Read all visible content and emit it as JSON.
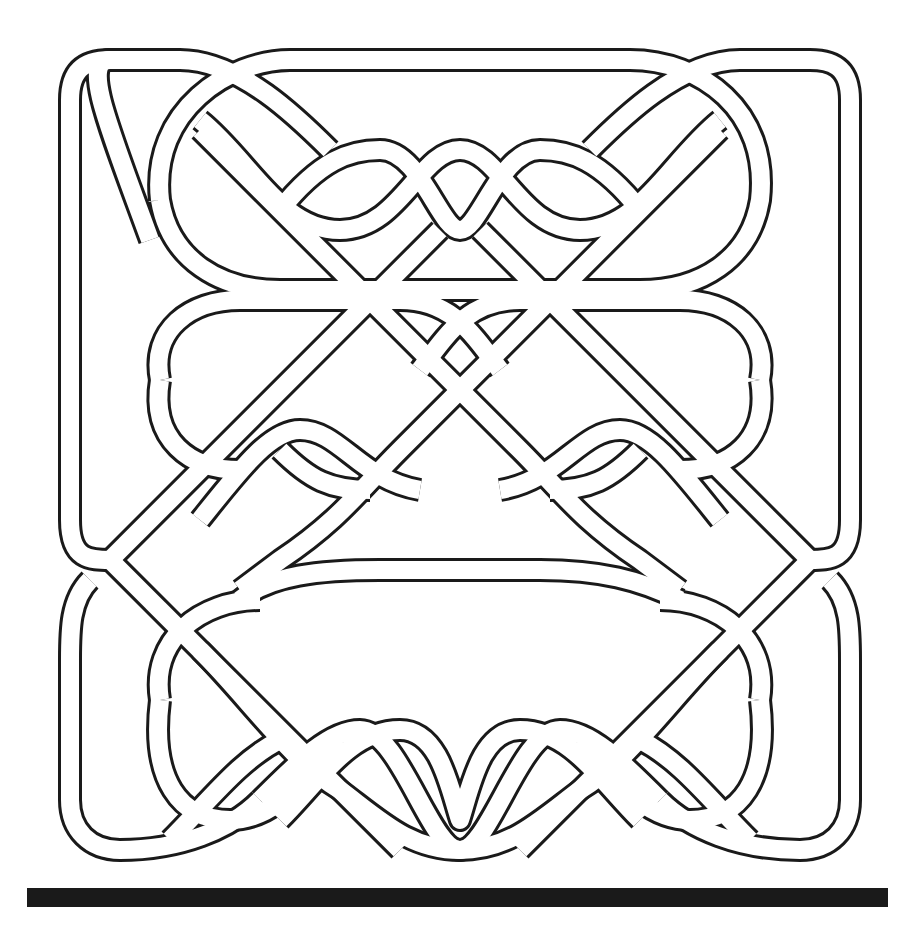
{
  "figure": {
    "kind": "celtic-knot-line-art",
    "stroke_color": "#1a1a1a",
    "fill_color": "#ffffff",
    "background": "#ffffff"
  },
  "base_bar": {
    "color": "#1a1a1a"
  }
}
